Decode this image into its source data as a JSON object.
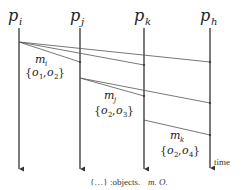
{
  "processes": [
    {
      "id": "pi",
      "base": "p",
      "sub": "i",
      "x": 19
    },
    {
      "id": "pj",
      "base": "p",
      "sub": "j",
      "x": 80
    },
    {
      "id": "pk",
      "base": "p",
      "sub": "k",
      "x": 144
    },
    {
      "id": "ph",
      "base": "p",
      "sub": "h",
      "x": 210
    }
  ],
  "messages": [
    {
      "name": "m_i",
      "base": "m",
      "sub": "i",
      "objects": "{o1, o2}",
      "obj_a": "o",
      "obj_a_sub": "1",
      "obj_b": "o",
      "obj_b_sub": "2",
      "from": "pi",
      "to": [
        "pj",
        "pk",
        "ph"
      ]
    },
    {
      "name": "m_j",
      "base": "m",
      "sub": "j",
      "objects": "{o2, o3}",
      "obj_a": "o",
      "obj_a_sub": "2",
      "obj_b": "o",
      "obj_b_sub": "3",
      "from": "pj",
      "to": [
        "pk",
        "ph"
      ]
    },
    {
      "name": "m_k",
      "base": "m",
      "sub": "k",
      "objects": "{o2, o4}",
      "obj_a": "o",
      "obj_a_sub": "2",
      "obj_b": "o",
      "obj_b_sub": "4",
      "from": "pk",
      "to": [
        "ph"
      ]
    }
  ],
  "time_label": "time",
  "legend": {
    "braces": "{…}",
    "objects_text": ":objects.",
    "m_label": "m.",
    "o_label": "O."
  },
  "colors": {
    "lifeline": "#333333",
    "message": "#555555",
    "text": "#222222"
  }
}
